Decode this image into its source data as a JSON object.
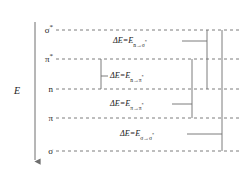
{
  "figure": {
    "type": "molecular-orbital-energy-level-diagram",
    "background_color": "#ffffff",
    "line_color": "#6e6e6e",
    "text_color": "#1a1a1a",
    "width": 245,
    "height": 173
  },
  "axis": {
    "label": "E",
    "name": "energy",
    "direction": "arrow-down",
    "x": 35,
    "y_top": 22,
    "y_bottom": 160,
    "label_x": 14,
    "label_y": 86
  },
  "levels": [
    {
      "id": "sigma-star",
      "label": "σ",
      "star": "*",
      "y": 30,
      "label_x": 53
    },
    {
      "id": "pi-star",
      "label": "π",
      "star": "*",
      "y": 59,
      "label_x": 53
    },
    {
      "id": "n",
      "label": "n",
      "star": "",
      "y": 89,
      "label_x": 53
    },
    {
      "id": "pi",
      "label": "π",
      "star": "",
      "y": 118,
      "label_x": 53
    },
    {
      "id": "sigma",
      "label": "σ",
      "star": "",
      "y": 151,
      "label_x": 53
    }
  ],
  "level_line": {
    "x_start": 56,
    "x_end": 240,
    "dash": "3,3"
  },
  "transitions": [
    {
      "id": "n-to-sigma-star",
      "prefix": "ΔE=E",
      "subscript": "n→σ",
      "sub_star": "*",
      "text_x": 113,
      "text_y": 41,
      "bracket_x": 207,
      "y_upper": 30,
      "y_lower": 89,
      "tick_y": 41,
      "tick_x_start": 182,
      "tick_x_end": 207
    },
    {
      "id": "n-to-pi-star",
      "prefix": "ΔE=E",
      "subscript": "n→π",
      "sub_star": "*",
      "text_x": 110,
      "text_y": 76,
      "bracket_x": 101,
      "y_upper": 59,
      "y_lower": 89,
      "tick_y": 76,
      "tick_x_start": 101,
      "tick_x_end": 108
    },
    {
      "id": "pi-to-pi-star",
      "prefix": "ΔE=E",
      "subscript": "π→π",
      "sub_star": "*",
      "text_x": 110,
      "text_y": 104,
      "bracket_x": 192,
      "y_upper": 59,
      "y_lower": 118,
      "tick_y": 104,
      "tick_x_start": 172,
      "tick_x_end": 192
    },
    {
      "id": "sigma-to-sigma-star",
      "prefix": "ΔE=E",
      "subscript": "σ→σ",
      "sub_star": "*",
      "text_x": 120,
      "text_y": 134,
      "bracket_x": 222,
      "y_upper": 30,
      "y_lower": 151,
      "tick_y": 134,
      "tick_x_start": 187,
      "tick_x_end": 222
    }
  ]
}
